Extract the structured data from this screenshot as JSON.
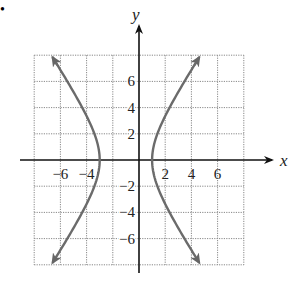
{
  "chart_data": {
    "type": "line",
    "title": "",
    "xlabel": "x",
    "ylabel": "y",
    "xlim": [
      -8,
      8
    ],
    "ylim": [
      -8,
      8
    ],
    "grid": true,
    "grid_step": 2,
    "x_ticks": [
      -6,
      -4,
      2,
      4,
      6
    ],
    "y_ticks": [
      6,
      4,
      2,
      -2,
      -4,
      -6
    ],
    "x_tick_labels": [
      "−6",
      "−4",
      "2",
      "4",
      "6"
    ],
    "y_tick_labels": [
      "6",
      "4",
      "2",
      "−2",
      "−4",
      "−6"
    ],
    "equation": "(x+1)^2/4 - y^2/9 = 1",
    "center": [
      -1,
      0
    ],
    "vertices": [
      [
        -3,
        0
      ],
      [
        1,
        0
      ]
    ],
    "series": [
      {
        "name": "left branch",
        "x": [
          -6.8,
          -5.2,
          -4.2,
          -3.5,
          -3.0,
          -3.5,
          -4.2,
          -5.2,
          -6.8
        ],
        "y": [
          8,
          6,
          4,
          2,
          0,
          -2,
          -4,
          -6,
          -8
        ]
      },
      {
        "name": "right branch",
        "x": [
          4.8,
          3.2,
          2.2,
          1.5,
          1.0,
          1.5,
          2.2,
          3.2,
          4.8
        ],
        "y": [
          8,
          6,
          4,
          2,
          0,
          -2,
          -4,
          -6,
          -8
        ]
      }
    ],
    "curve_color": "#6b6b6b"
  },
  "labels": {
    "x_axis": "x",
    "y_axis": "y",
    "bullet": "•"
  }
}
